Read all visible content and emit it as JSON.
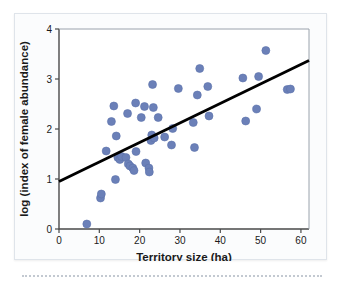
{
  "figure": {
    "background_color": "#fbfcfd",
    "border_color": "#dfe4ea",
    "point_color": "#6b80b8",
    "point_stroke_color": "#5d72ab",
    "line_color": "#000000",
    "axis_color": "#4a4a4a",
    "text_color": "#1a1a1a"
  },
  "chart_data": {
    "type": "scatter",
    "title": "",
    "xlabel": "Territory size (ha)",
    "ylabel": "log (index of female abundance)",
    "xlim": [
      0,
      62
    ],
    "ylim": [
      0,
      4
    ],
    "xticks": [
      0,
      10,
      20,
      30,
      40,
      50,
      60
    ],
    "xtick_labels": [
      "0",
      "10",
      "20",
      "30",
      "40",
      "50",
      "60"
    ],
    "yticks": [
      0,
      1,
      2,
      3,
      4
    ],
    "ytick_labels": [
      "0",
      "1",
      "2",
      "3",
      "4"
    ],
    "grid": false,
    "legend": null,
    "points": [
      {
        "x": 6.9,
        "y": 0.1
      },
      {
        "x": 10.3,
        "y": 0.62
      },
      {
        "x": 10.5,
        "y": 0.7
      },
      {
        "x": 11.7,
        "y": 1.56
      },
      {
        "x": 13.0,
        "y": 2.15
      },
      {
        "x": 13.6,
        "y": 2.46
      },
      {
        "x": 14.0,
        "y": 0.99
      },
      {
        "x": 14.2,
        "y": 1.86
      },
      {
        "x": 14.6,
        "y": 1.43
      },
      {
        "x": 15.1,
        "y": 1.39
      },
      {
        "x": 15.5,
        "y": 1.45
      },
      {
        "x": 16.6,
        "y": 1.43
      },
      {
        "x": 17.0,
        "y": 2.31
      },
      {
        "x": 17.2,
        "y": 1.3
      },
      {
        "x": 17.6,
        "y": 1.26
      },
      {
        "x": 18.3,
        "y": 1.22
      },
      {
        "x": 18.6,
        "y": 1.17
      },
      {
        "x": 19.0,
        "y": 2.52
      },
      {
        "x": 19.1,
        "y": 1.55
      },
      {
        "x": 20.4,
        "y": 2.23
      },
      {
        "x": 21.2,
        "y": 2.45
      },
      {
        "x": 21.5,
        "y": 1.32
      },
      {
        "x": 22.3,
        "y": 1.22
      },
      {
        "x": 22.4,
        "y": 1.14
      },
      {
        "x": 22.8,
        "y": 1.77
      },
      {
        "x": 23.0,
        "y": 1.88
      },
      {
        "x": 23.2,
        "y": 2.89
      },
      {
        "x": 23.4,
        "y": 2.43
      },
      {
        "x": 23.6,
        "y": 1.82
      },
      {
        "x": 24.6,
        "y": 2.23
      },
      {
        "x": 26.2,
        "y": 1.84
      },
      {
        "x": 27.9,
        "y": 1.68
      },
      {
        "x": 28.2,
        "y": 2.01
      },
      {
        "x": 29.6,
        "y": 2.81
      },
      {
        "x": 33.3,
        "y": 2.13
      },
      {
        "x": 33.6,
        "y": 1.63
      },
      {
        "x": 34.3,
        "y": 2.68
      },
      {
        "x": 34.9,
        "y": 3.21
      },
      {
        "x": 36.9,
        "y": 2.85
      },
      {
        "x": 37.2,
        "y": 2.26
      },
      {
        "x": 45.6,
        "y": 3.02
      },
      {
        "x": 46.3,
        "y": 2.16
      },
      {
        "x": 49.0,
        "y": 2.4
      },
      {
        "x": 49.5,
        "y": 3.05
      },
      {
        "x": 51.3,
        "y": 3.57
      },
      {
        "x": 56.6,
        "y": 2.79
      },
      {
        "x": 57.4,
        "y": 2.8
      }
    ],
    "trendline": {
      "type": "linear-regression",
      "x_start": 0,
      "y_start": 0.95,
      "x_end": 62,
      "y_end": 3.37
    }
  }
}
